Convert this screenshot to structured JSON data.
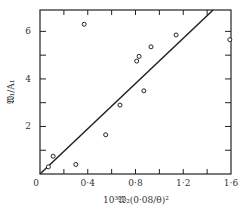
{
  "chart_data": {
    "type": "scatter",
    "title": "",
    "xlabel": "10³𝔚₂(0·08/θ)²",
    "ylabel": "𝔚₁/A₁",
    "xlim": [
      0,
      1.6
    ],
    "ylim": [
      0,
      6.9
    ],
    "grid": false,
    "legend": null,
    "x_ticks": [
      0,
      0.4,
      0.8,
      1.2,
      1.6
    ],
    "x_tick_labels": [
      "0",
      "0·4",
      "0·8",
      "1·2",
      "1·6"
    ],
    "y_ticks": [
      0,
      2,
      4,
      6
    ],
    "y_tick_labels": [
      "0",
      "2",
      "4",
      "6"
    ],
    "y_minor_ticks": [
      1,
      3,
      5
    ],
    "x_minor_ticks": [
      0.2,
      0.6,
      1.0,
      1.4
    ],
    "series": [
      {
        "name": "observations",
        "marker": "open-circle",
        "points": [
          {
            "x": 0.07,
            "y": 0.3
          },
          {
            "x": 0.11,
            "y": 0.75
          },
          {
            "x": 0.3,
            "y": 0.4
          },
          {
            "x": 0.37,
            "y": 6.3
          },
          {
            "x": 0.55,
            "y": 1.65
          },
          {
            "x": 0.67,
            "y": 2.9
          },
          {
            "x": 0.81,
            "y": 4.75
          },
          {
            "x": 0.83,
            "y": 4.95
          },
          {
            "x": 0.87,
            "y": 3.5
          },
          {
            "x": 0.93,
            "y": 5.35
          },
          {
            "x": 1.14,
            "y": 5.85
          },
          {
            "x": 1.59,
            "y": 5.65
          }
        ]
      },
      {
        "name": "fit-line",
        "style": "solid",
        "points": [
          {
            "x": 0,
            "y": 0
          },
          {
            "x": 1.45,
            "y": 6.9
          }
        ]
      }
    ]
  },
  "labels": {
    "origin": "0"
  },
  "colors": {
    "ink": "#222222",
    "background": "#ffffff"
  }
}
